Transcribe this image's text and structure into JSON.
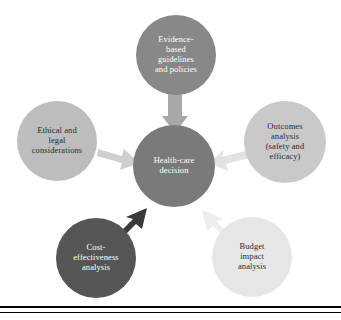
{
  "figure": {
    "background_color": "#ffffff",
    "width": 341,
    "height": 320
  },
  "center_node": {
    "id": "health-care-decision",
    "label": "Health-care\ndecision",
    "fill_color": "#7a7a7a",
    "text_color": "#ffffff",
    "font_size": "8.5px",
    "cx": 174,
    "cy": 166,
    "r": 41
  },
  "nodes": [
    {
      "id": "evidence-based-guidelines",
      "label": "Evidence-\nbased\nguidelines\nand policies",
      "fill_color": "#888888",
      "text_color": "#ffffff",
      "font_size": "8.5px",
      "cx": 176,
      "cy": 55,
      "r": 40,
      "position": "top"
    },
    {
      "id": "outcomes-analysis",
      "label": "Outcomes\nanalysis\n(safety and\nefficacy)",
      "fill_color": "#c9c9c9",
      "text_color": "#2b2b2b",
      "font_size": "8.5px",
      "cx": 285,
      "cy": 142,
      "r": 41,
      "position": "right"
    },
    {
      "id": "ethical-legal-considerations",
      "label": "Ethical and\nlegal\nconsiderations",
      "fill_color": "#bdbdbd",
      "text_color": "#2b2b2b",
      "font_size": "8.5px",
      "cx": 57,
      "cy": 141,
      "r": 40,
      "position": "left"
    },
    {
      "id": "cost-effectiveness-analysis",
      "label": "Cost-\neffectiveness\nanalysis",
      "fill_color": "#555555",
      "text_color": "#ffffff",
      "font_size": "8.5px",
      "cx": 96,
      "cy": 258,
      "r": 40,
      "position": "bottom-left"
    },
    {
      "id": "budget-impact-analysis",
      "label": "Budget\nimpact\nanalysis",
      "fill_color": "#e6e6e6",
      "text_color": "#2b2b2b",
      "font_size": "8.5px",
      "cx": 252,
      "cy": 257,
      "r": 40,
      "position": "bottom-right"
    }
  ],
  "arrows": [
    {
      "id": "arrow-evidence-to-center",
      "from": "evidence-based-guidelines",
      "to": "health-care-decision",
      "color": "#a8a8a8",
      "direction": "down"
    },
    {
      "id": "arrow-ethical-to-center",
      "from": "ethical-legal-considerations",
      "to": "health-care-decision",
      "color": "#cfcfcf",
      "direction": "right-down"
    },
    {
      "id": "arrow-outcomes-to-center",
      "from": "outcomes-analysis",
      "to": "health-care-decision",
      "color": "#e2e2e2",
      "direction": "left-down"
    },
    {
      "id": "arrow-cost-to-center",
      "from": "cost-effectiveness-analysis",
      "to": "health-care-decision",
      "color": "#3a3a3a",
      "direction": "up-right"
    },
    {
      "id": "arrow-budget-to-center",
      "from": "budget-impact-analysis",
      "to": "health-care-decision",
      "color": "#ededed",
      "direction": "up-left"
    }
  ],
  "rules": [
    {
      "id": "bottom-rule-thick",
      "y": 306,
      "thickness": 2,
      "color": "#000000"
    },
    {
      "id": "bottom-rule-thin",
      "y": 312,
      "thickness": 1,
      "color": "#000000"
    }
  ]
}
